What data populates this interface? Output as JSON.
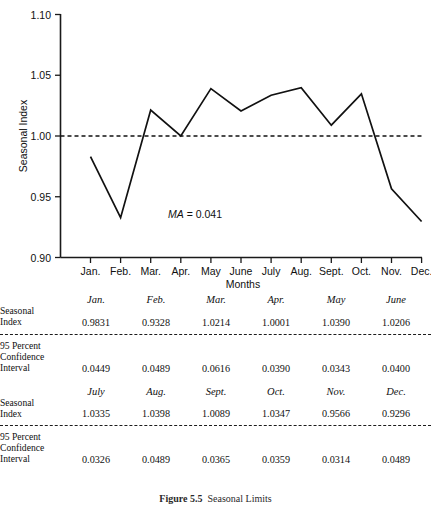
{
  "figure": {
    "caption_number": "Figure 5.5",
    "caption_text": "Seasonal Limits"
  },
  "chart_data": {
    "type": "line",
    "title": "",
    "xlabel": "Months",
    "ylabel": "Seasonal Index",
    "categories": [
      "Jan.",
      "Feb.",
      "Mar.",
      "Apr.",
      "May",
      "June",
      "July",
      "Aug.",
      "Sept.",
      "Oct.",
      "Nov.",
      "Dec."
    ],
    "values": [
      0.9831,
      0.9328,
      1.0214,
      1.0001,
      1.039,
      1.0206,
      1.0335,
      1.0398,
      1.0089,
      1.0347,
      0.9566,
      0.9296
    ],
    "series": [
      {
        "name": "Seasonal Index",
        "values": [
          0.9831,
          0.9328,
          1.0214,
          1.0001,
          1.039,
          1.0206,
          1.0335,
          1.0398,
          1.0089,
          1.0347,
          0.9566,
          0.9296
        ]
      }
    ],
    "ylim": [
      0.9,
      1.1
    ],
    "ytick_labels": [
      "1.10",
      "1.05",
      "1.00",
      "0.95",
      "0.90"
    ],
    "ytick_values": [
      1.1,
      1.05,
      1.0,
      0.95,
      0.9
    ],
    "reference_line": {
      "value": 1.0,
      "style": "dashed"
    },
    "annotation": {
      "symbol": "MA",
      "equals": " = ",
      "value": "0.041",
      "full_text": "MA = 0.041"
    },
    "grid": false,
    "legend": "none"
  },
  "table": {
    "row_labels": {
      "seasonal_index": [
        "Seasonal",
        "Index"
      ],
      "confidence_interval": [
        "95 Percent",
        "Confidence",
        "Interval"
      ]
    },
    "blocks": [
      {
        "months": [
          "Jan.",
          "Feb.",
          "Mar.",
          "Apr.",
          "May",
          "June"
        ],
        "seasonal_index": [
          "0.9831",
          "0.9328",
          "1.0214",
          "1.0001",
          "1.0390",
          "1.0206"
        ],
        "confidence_interval": [
          "0.0449",
          "0.0489",
          "0.0616",
          "0.0390",
          "0.0343",
          "0.0400"
        ]
      },
      {
        "months": [
          "July",
          "Aug.",
          "Sept.",
          "Oct.",
          "Nov.",
          "Dec."
        ],
        "seasonal_index": [
          "1.0335",
          "1.0398",
          "1.0089",
          "1.0347",
          "0.9566",
          "0.9296"
        ],
        "confidence_interval": [
          "0.0326",
          "0.0489",
          "0.0365",
          "0.0359",
          "0.0314",
          "0.0489"
        ]
      }
    ]
  },
  "colors": {
    "ink": "#111111",
    "background": "#ffffff"
  }
}
